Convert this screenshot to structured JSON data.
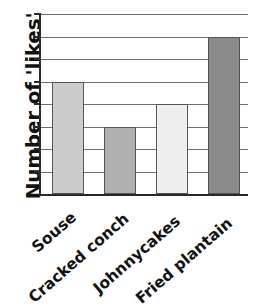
{
  "chart_data": {
    "type": "bar",
    "title": "",
    "subtitle": "",
    "xlabel": "",
    "ylabel": "Number of 'likes'",
    "categories": [
      "Souse",
      "Cracked conch",
      "Johnnycakes",
      "Fried plantain"
    ],
    "values": [
      5,
      3,
      4,
      7
    ],
    "series": [
      {
        "name": "Number of 'likes'",
        "values": [
          5,
          3,
          4,
          7
        ]
      }
    ],
    "ylim": [
      0,
      8
    ],
    "y_tick_values": [
      0,
      1,
      2,
      3,
      4,
      5,
      6,
      7,
      8
    ],
    "y_tick_labels": [
      "",
      "",
      "",
      "",
      "",
      "",
      "",
      "",
      ""
    ],
    "grid": true,
    "grid_axis": "y",
    "legend": false,
    "legend_position": "none",
    "annotations": [],
    "bar_colors": [
      "#cccccc",
      "#b0b0b0",
      "#eeeeee",
      "#8b8b8b"
    ],
    "bar_edge_color": "#555555",
    "axis_color": "#2a2a2a",
    "gridline_color": "#6e6e6e",
    "background_color": "#ffffff",
    "text_color": "#111111",
    "x_label_rotation": -41
  }
}
